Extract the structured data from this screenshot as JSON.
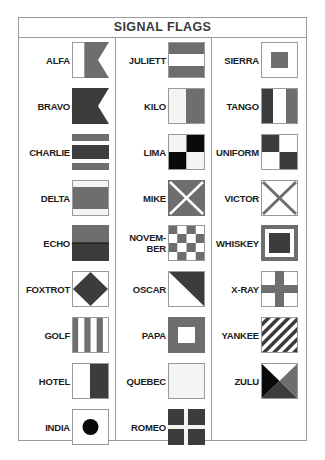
{
  "title": "SIGNAL FLAGS",
  "colors": {
    "gray": "#6e6e6e",
    "dark": "#3c3c3c",
    "black": "#0a0a0a",
    "white": "#ffffff",
    "light": "#f4f4f4",
    "border": "#9a9a9a"
  },
  "columns": [
    {
      "flags": [
        {
          "label": "ALFA",
          "pattern": "alfa"
        },
        {
          "label": "BRAVO",
          "pattern": "bravo"
        },
        {
          "label": "CHARLIE",
          "pattern": "charlie"
        },
        {
          "label": "DELTA",
          "pattern": "delta"
        },
        {
          "label": "ECHO",
          "pattern": "echo"
        },
        {
          "label": "FOXTROT",
          "pattern": "foxtrot"
        },
        {
          "label": "GOLF",
          "pattern": "golf"
        },
        {
          "label": "HOTEL",
          "pattern": "hotel"
        },
        {
          "label": "INDIA",
          "pattern": "india"
        }
      ]
    },
    {
      "flags": [
        {
          "label": "JULIETT",
          "pattern": "juliett"
        },
        {
          "label": "KILO",
          "pattern": "kilo"
        },
        {
          "label": "LIMA",
          "pattern": "lima"
        },
        {
          "label": "MIKE",
          "pattern": "mike"
        },
        {
          "label": "NOVEM-\nBER",
          "pattern": "november"
        },
        {
          "label": "OSCAR",
          "pattern": "oscar"
        },
        {
          "label": "PAPA",
          "pattern": "papa"
        },
        {
          "label": "QUEBEC",
          "pattern": "quebec"
        },
        {
          "label": "ROMEO",
          "pattern": "romeo"
        }
      ]
    },
    {
      "flags": [
        {
          "label": "SIERRA",
          "pattern": "sierra"
        },
        {
          "label": "TANGO",
          "pattern": "tango"
        },
        {
          "label": "UNIFORM",
          "pattern": "uniform"
        },
        {
          "label": "VICTOR",
          "pattern": "victor"
        },
        {
          "label": "WHISKEY",
          "pattern": "whiskey"
        },
        {
          "label": "X-RAY",
          "pattern": "xray"
        },
        {
          "label": "YANKEE",
          "pattern": "yankee"
        },
        {
          "label": "ZULU",
          "pattern": "zulu"
        }
      ]
    }
  ]
}
